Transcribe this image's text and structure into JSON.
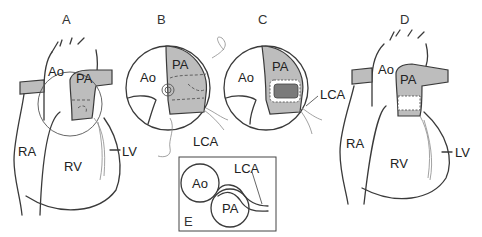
{
  "figure": {
    "panels": [
      {
        "id": "A",
        "label": "A",
        "structures": {
          "ao": "Ao",
          "pa": "PA",
          "ra": "RA",
          "rv": "RV",
          "lv": "LV"
        }
      },
      {
        "id": "B",
        "label": "B",
        "structures": {
          "ao": "Ao",
          "pa": "PA",
          "lca": "LCA"
        }
      },
      {
        "id": "C",
        "label": "C",
        "structures": {
          "ao": "Ao",
          "pa": "PA",
          "lca": "LCA"
        }
      },
      {
        "id": "D",
        "label": "D",
        "structures": {
          "ao": "Ao",
          "pa": "PA",
          "ra": "RA",
          "rv": "RV",
          "lv": "LV"
        }
      },
      {
        "id": "E",
        "label": "E",
        "structures": {
          "ao": "Ao",
          "pa": "PA",
          "lca": "LCA"
        }
      }
    ],
    "colors": {
      "line": "#3a3a3a",
      "pa_fill": "#bdbdbd",
      "patch_dark": "#7a7a7a",
      "background": "#ffffff"
    }
  }
}
